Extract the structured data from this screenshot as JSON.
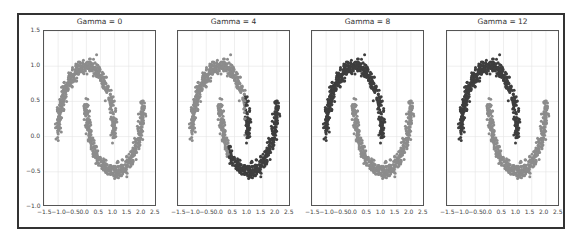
{
  "chart_data": {
    "type": "scatter",
    "layout": "1x4 subplots",
    "grid": true,
    "xlim": [
      -1.5,
      2.5
    ],
    "ylim": [
      -1.0,
      1.5
    ],
    "xticks": [
      "−1.5",
      "−1.0",
      "−0.5",
      "0.0",
      "0.5",
      "1.0",
      "1.5",
      "2.0",
      "2.5"
    ],
    "yticks": [
      "1.5",
      "1.0",
      "0.5",
      "0.0",
      "−0.5",
      "−1.0"
    ],
    "dataset": "two interleaving half-moons",
    "colors": {
      "light": "#8c8c8c",
      "dark": "#3e3e3e"
    },
    "panels": [
      {
        "title": "Gamma = 0",
        "split_rule": "all_light"
      },
      {
        "title": "Gamma = 4",
        "split_rule": "x_greater_than_0.9_dark"
      },
      {
        "title": "Gamma = 8",
        "split_rule": "upper_moon_dark"
      },
      {
        "title": "Gamma = 12",
        "split_rule": "upper_moon_dark"
      }
    ],
    "series": [
      {
        "name": "upper moon",
        "shape": "arc centered (0,0) r=1, x from -1 to 1, y from 0 to 1"
      },
      {
        "name": "lower moon",
        "shape": "arc centered (1,0.5) r=1, x from 0 to 2, y from 0.5 to -0.5"
      }
    ]
  }
}
